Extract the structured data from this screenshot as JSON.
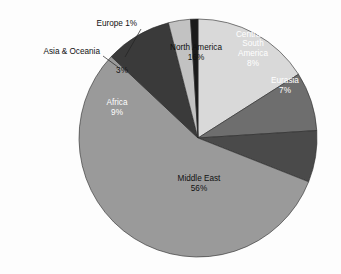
{
  "chart_data": {
    "type": "pie",
    "title": "",
    "subtitle": "",
    "xlabel": "",
    "ylabel": "",
    "legend_position": "none",
    "grid": false,
    "units": "percent",
    "total": 100,
    "start_angle_deg": 0,
    "direction": "clockwise",
    "categories": [
      "North America",
      "Central & South America",
      "Eurasia",
      "Middle East",
      "Africa",
      "Asia & Oceania",
      "Europe"
    ],
    "values": [
      16,
      8,
      7,
      56,
      9,
      3,
      1
    ],
    "slices": [
      {
        "name": "North America",
        "value": 16,
        "label_text": "North America",
        "value_text": "16%",
        "color": "#d9d9d9",
        "label_placement": "inside",
        "text_color": "dark",
        "label_x": 196,
        "label_y": 53
      },
      {
        "name": "Central & South America",
        "value": 8,
        "label_text": "Central & South America",
        "label_lines": [
          "Central &",
          "South",
          "America"
        ],
        "value_text": "8%",
        "color": "#6e6e6e",
        "label_placement": "inside",
        "text_color": "light",
        "label_x": 253,
        "label_y": 49
      },
      {
        "name": "Eurasia",
        "value": 7,
        "label_text": "Eurasia",
        "value_text": "7%",
        "color": "#4a4a4a",
        "label_placement": "inside",
        "text_color": "light",
        "label_x": 285,
        "label_y": 86
      },
      {
        "name": "Middle East",
        "value": 56,
        "label_text": "Middle East",
        "value_text": "56%",
        "color": "#9a9a9a",
        "label_placement": "inside",
        "text_color": "dark",
        "label_x": 199,
        "label_y": 184
      },
      {
        "name": "Africa",
        "value": 9,
        "label_text": "Africa",
        "value_text": "9%",
        "color": "#3a3a3a",
        "label_placement": "inside",
        "text_color": "light",
        "label_x": 117,
        "label_y": 108
      },
      {
        "name": "Asia & Oceania",
        "value": 3,
        "label_text": "Asia & Oceania",
        "value_text": "3%",
        "color": "#c2c2c2",
        "label_placement": "callout",
        "text_color": "dark",
        "callout_text_x": 100,
        "callout_text_y": 52,
        "value_x": 122,
        "value_y": 71
      },
      {
        "name": "Europe",
        "value": 1,
        "label_text": "Europe 1%",
        "value_text": "1%",
        "color": "#1a1a1a",
        "label_placement": "callout",
        "text_color": "dark",
        "callout_text_x": 137,
        "callout_text_y": 24
      }
    ],
    "geometry": {
      "center_x": 198,
      "center_y": 138,
      "radius": 119
    },
    "callouts": [
      {
        "name": "europe-callout",
        "text": "Europe 1%",
        "text_x": 137,
        "text_y": 24,
        "line_from_x": 141,
        "line_from_y": 29,
        "line_to_x": 125,
        "line_to_y": 57
      },
      {
        "name": "asia-oceania-callout",
        "text": "Asia & Oceania",
        "text_x": 100,
        "text_y": 52,
        "line_from_x": 103,
        "line_from_y": 56,
        "line_to_x": 118,
        "line_to_y": 67
      }
    ]
  }
}
